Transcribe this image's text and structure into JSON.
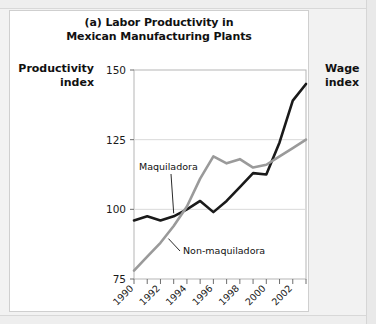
{
  "figure": {
    "panel_label": "(a)",
    "title_line1": "(a) Labor Productivity in",
    "title_line2": "Mexican Manufacturing Plants",
    "left_axis_title_line1": "Productivity",
    "left_axis_title_line2": "index",
    "right_axis_title_line1": "Wage",
    "right_axis_title_line2": "index"
  },
  "chart_data": {
    "type": "line",
    "title": "(a) Labor Productivity in Mexican Manufacturing Plants",
    "xlabel": "",
    "ylabel": "Productivity index",
    "ylabel_right": "Wage index",
    "ylim": [
      75,
      150
    ],
    "yticks": [
      75,
      100,
      125,
      150
    ],
    "ytick_labels": [
      "75",
      "100",
      "125",
      "150"
    ],
    "xlim": [
      1990,
      2003
    ],
    "x": [
      1990,
      1991,
      1992,
      1993,
      1994,
      1995,
      1996,
      1997,
      1998,
      1999,
      2000,
      2001,
      2002,
      2003
    ],
    "xticks": [
      1990,
      1991,
      1992,
      1993,
      1994,
      1995,
      1996,
      1997,
      1998,
      1999,
      2000,
      2001,
      2002,
      2003
    ],
    "xtick_labels_shown": [
      "1990",
      "1992",
      "1994",
      "1996",
      "1998",
      "2000",
      "2002"
    ],
    "xtick_labels_shown_values": [
      1990,
      1992,
      1994,
      1996,
      1998,
      2000,
      2002
    ],
    "grid": "horizontal",
    "legend_position": "inline-annotation",
    "series": [
      {
        "name": "Maquiladora",
        "color": "#1a1a1a",
        "values": [
          96,
          97.5,
          96,
          97.5,
          100,
          103,
          99,
          103,
          108,
          113,
          112.5,
          124,
          139,
          145
        ]
      },
      {
        "name": "Non-maquiladora",
        "color": "#9a9a9a",
        "values": [
          78,
          83,
          88,
          94,
          101,
          111,
          119,
          116.5,
          118,
          115,
          116,
          119,
          122,
          125
        ]
      }
    ],
    "annotations": [
      {
        "text": "Maquiladora",
        "series": "Maquiladora"
      },
      {
        "text": "Non-maquiladora",
        "series": "Non-maquiladora"
      }
    ]
  }
}
